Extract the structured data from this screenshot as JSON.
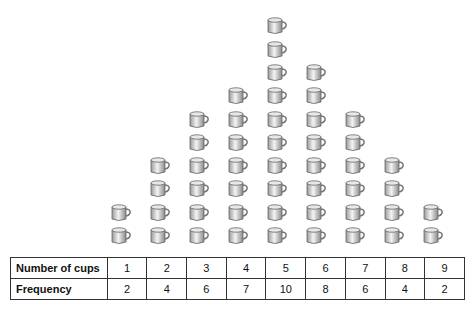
{
  "chart_data": {
    "type": "pictograph",
    "title": "",
    "categories": [
      "1",
      "2",
      "3",
      "4",
      "5",
      "6",
      "7",
      "8",
      "9"
    ],
    "values": [
      2,
      4,
      6,
      7,
      10,
      8,
      6,
      4,
      2
    ],
    "xlabel": "Number of cups",
    "ylabel": "Frequency",
    "icon": "cup-icon",
    "grid": false
  },
  "table": {
    "row1_label": "Number of cups",
    "row2_label": "Frequency",
    "cups": [
      "1",
      "2",
      "3",
      "4",
      "5",
      "6",
      "7",
      "8",
      "9"
    ],
    "frequency": [
      "2",
      "4",
      "6",
      "7",
      "10",
      "8",
      "6",
      "4",
      "2"
    ]
  }
}
